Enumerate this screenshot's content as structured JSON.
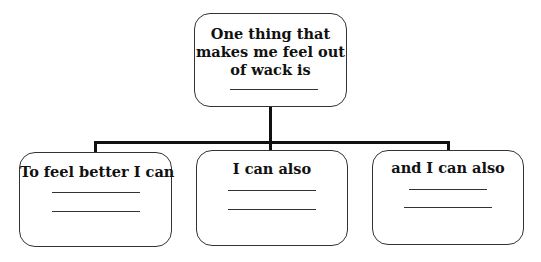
{
  "diagram": {
    "type": "tree",
    "root": {
      "text_lines": [
        "One thing that",
        "makes me feel out",
        "of wack is"
      ],
      "blanks": 1
    },
    "children": [
      {
        "text": "To feel better I can",
        "blanks": 2
      },
      {
        "text": "I can also",
        "blanks": 2
      },
      {
        "text": "and I can also",
        "blanks": 2
      }
    ],
    "colors": {
      "stroke": "#333333",
      "connector": "#111111",
      "text": "#111111",
      "background": "#ffffff"
    }
  }
}
